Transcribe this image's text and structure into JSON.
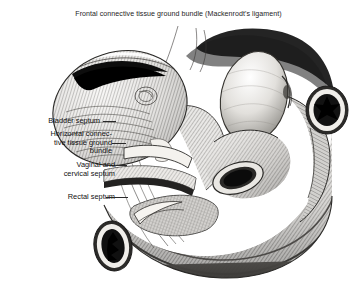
{
  "figure": {
    "title": "Frontal connective tissue ground bundle (Mackenrodt's ligament)",
    "background_color": "#ffffff",
    "ink_color": "#1b1b1b",
    "medium": "engraving / crosshatch line drawing"
  },
  "labels": {
    "bladder_septum": "Bladder septum",
    "horizontal_bundle_line1": "Horizontal connec-",
    "horizontal_bundle_line2": "tive tissue ground",
    "horizontal_bundle_line3": "bundle",
    "vaginal_line1": "Vaginal and",
    "vaginal_line2": "cervical septum",
    "rectal_septum": "Rectal septum"
  },
  "structures": {
    "bladder_mass": "bladder",
    "pale_ovoid_organ": "uterus",
    "tube_cross_section_right": "rectum cut cross-section",
    "tube_cross_section_lower_left": "vessel cut cross-section",
    "pelvic_floor_bands": "pelvic floor connective tissue bands"
  }
}
